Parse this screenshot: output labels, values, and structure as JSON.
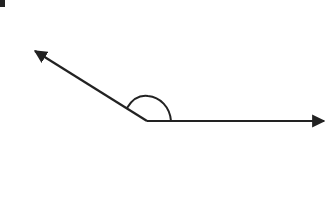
{
  "diagram": {
    "type": "angle",
    "vertex": {
      "x": 147,
      "y": 121
    },
    "ray_left": {
      "to": {
        "x": 33,
        "y": 50
      },
      "arrowhead": true
    },
    "ray_right": {
      "to": {
        "x": 326,
        "y": 121
      },
      "arrowhead": true
    },
    "angle_arc": {
      "start": {
        "x": 127,
        "y": 108
      },
      "end": {
        "x": 171,
        "y": 121
      }
    },
    "stroke_color": "#222222",
    "background_color": "#ffffff"
  }
}
